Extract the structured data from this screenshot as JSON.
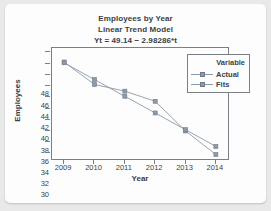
{
  "chart_data": {
    "type": "line",
    "title": "Employees by Year",
    "subtitle": "Linear Trend Model",
    "equation": "Yt = 49.14 − 2.98286*t",
    "xlabel": "Year",
    "ylabel": "Employees",
    "categories": [
      "2009",
      "2010",
      "2011",
      "2012",
      "2013",
      "2014"
    ],
    "x": [
      2009,
      2010,
      2011,
      2012,
      2013,
      2014
    ],
    "series": [
      {
        "name": "Actual",
        "values": [
          46.3,
          42.3,
          41.1,
          39.3,
          34.0,
          29.8
        ],
        "color": "#8e9aa8"
      },
      {
        "name": "Fits",
        "values": [
          46.16,
          43.17,
          40.19,
          37.21,
          34.23,
          31.24
        ],
        "color": "#8e9aa8"
      }
    ],
    "ylim": [
      29,
      48.8
    ],
    "xlim": [
      2008.6,
      2014.4
    ],
    "yticks": [
      48,
      46,
      44,
      42,
      40,
      38,
      36,
      34,
      32,
      30
    ],
    "xticks": [
      "2009",
      "2010",
      "2011",
      "2012",
      "2013",
      "2014"
    ],
    "grid": false,
    "legend_position": "top-right"
  },
  "legend": {
    "title": "Variable",
    "entries": [
      "Actual",
      "Fits"
    ]
  },
  "colors": {
    "axis": "#7a7f87",
    "text": "#3b3f46",
    "series": "#8e9aa8",
    "card": "#fdfdfd",
    "page": "#e9e9e9"
  }
}
